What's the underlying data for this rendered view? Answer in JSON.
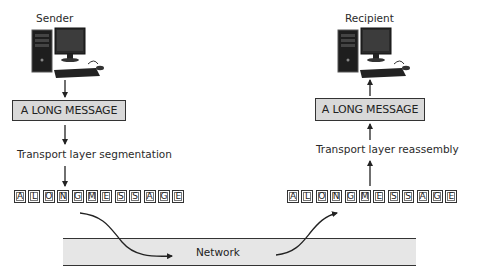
{
  "sender": {
    "label": "Sender",
    "computer_icon": "desktop-computer-icon",
    "message_box": "A LONG MESSAGE",
    "process_label": "Transport layer segmentation",
    "segments": [
      "A",
      "L",
      "O",
      "N",
      "G",
      "M",
      "E",
      "S",
      "S",
      "A",
      "G",
      "E"
    ]
  },
  "recipient": {
    "label": "Recipient",
    "computer_icon": "desktop-computer-icon",
    "message_box": "A LONG MESSAGE",
    "process_label": "Transport layer reassembly",
    "segments": [
      "A",
      "L",
      "O",
      "N",
      "G",
      "M",
      "E",
      "S",
      "S",
      "A",
      "G",
      "E"
    ]
  },
  "network": {
    "label": "Network"
  },
  "colors": {
    "message_box_fill": "#d9d9d9",
    "network_fill": "#e6e6e6",
    "line": "#333333"
  }
}
